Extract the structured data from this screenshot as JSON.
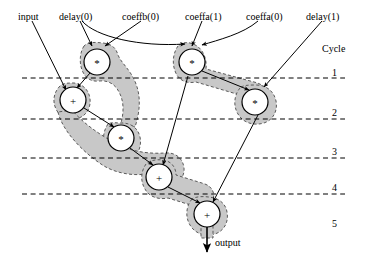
{
  "figure": {
    "type": "dataflow-scheduling-diagram",
    "title_text": "",
    "background_color": "#ffffff",
    "line_color": "#000000",
    "region_fill_color": "#c8c8c8",
    "region_border_color": "#555555",
    "node_fill_color": "#ffffff"
  },
  "top_labels": [
    {
      "id": "input",
      "text": "input",
      "x": 18,
      "y": 12
    },
    {
      "id": "delay0",
      "text": "delay(0)",
      "x": 59,
      "y": 12
    },
    {
      "id": "coeffb0",
      "text": "coeffb(0)",
      "x": 122,
      "y": 12
    },
    {
      "id": "coeffa1",
      "text": "coeffa(1)",
      "x": 185,
      "y": 12
    },
    {
      "id": "coeffa0",
      "text": "coeffa(0)",
      "x": 246,
      "y": 12
    },
    {
      "id": "delay1",
      "text": "delay(1)",
      "x": 306,
      "y": 12
    }
  ],
  "output_label": {
    "text": "output",
    "x": 215,
    "y": 238
  },
  "cycle_axis": {
    "header": "Cycle",
    "header_x": 322,
    "header_y": 44,
    "labels": [
      {
        "text": "1",
        "x": 332,
        "y": 68
      },
      {
        "text": "2",
        "x": 332,
        "y": 108
      },
      {
        "text": "3",
        "x": 332,
        "y": 147
      },
      {
        "text": "4",
        "x": 332,
        "y": 183
      },
      {
        "text": "5",
        "x": 332,
        "y": 219
      }
    ],
    "boundaries_y": [
      78,
      119,
      158,
      194
    ]
  },
  "nodes": [
    {
      "id": "m1",
      "op": "*",
      "cx": 97,
      "cy": 62,
      "r": 13,
      "cycle": 1,
      "label": "multiply-node-1"
    },
    {
      "id": "m2",
      "op": "*",
      "cx": 192,
      "cy": 62,
      "r": 13,
      "cycle": 1,
      "label": "multiply-node-2"
    },
    {
      "id": "a1",
      "op": "+",
      "cx": 73,
      "cy": 100,
      "r": 13,
      "cycle": 2,
      "label": "add-node-1"
    },
    {
      "id": "m3",
      "op": "*",
      "cx": 255,
      "cy": 102,
      "r": 13,
      "cycle": 2,
      "label": "multiply-node-3"
    },
    {
      "id": "m4",
      "op": "*",
      "cx": 121,
      "cy": 138,
      "r": 13,
      "cycle": 3,
      "label": "multiply-node-4"
    },
    {
      "id": "a2",
      "op": "+",
      "cx": 159,
      "cy": 177,
      "r": 13,
      "cycle": 4,
      "label": "add-node-2"
    },
    {
      "id": "a3",
      "op": "+",
      "cx": 207,
      "cy": 214,
      "r": 13,
      "cycle": 5,
      "label": "add-node-3"
    }
  ],
  "pointer_lines": [
    {
      "id": "input-to-a1",
      "from": [
        30,
        20
      ],
      "to": [
        63,
        92
      ],
      "arrow": true
    },
    {
      "id": "delay0-to-m1a",
      "from": [
        78,
        20
      ],
      "to": [
        90,
        46
      ],
      "arrow": true
    },
    {
      "id": "delay0-to-m2",
      "from": [
        80,
        20
      ],
      "to": [
        186,
        46
      ],
      "arrow": true
    },
    {
      "id": "coeffb0-to-m1",
      "from": [
        140,
        20
      ],
      "to": [
        104,
        46
      ],
      "arrow": true
    },
    {
      "id": "coeffa1-to-m2",
      "from": [
        200,
        20
      ],
      "to": [
        192,
        46
      ],
      "arrow": true
    },
    {
      "id": "coeffa0-to-m2b",
      "from": [
        258,
        20
      ],
      "to": [
        200,
        46
      ],
      "arrow": true
    },
    {
      "id": "delay1-to-m3",
      "from": [
        320,
        20
      ],
      "to": [
        262,
        88
      ],
      "arrow": true
    }
  ],
  "edges": [
    {
      "id": "m1-to-a1",
      "from": "m1",
      "to": "a1"
    },
    {
      "id": "a1-to-m4",
      "from": "a1",
      "to": "m4"
    },
    {
      "id": "m2-to-m3",
      "from": "m2",
      "to": "m3"
    },
    {
      "id": "m2-to-a2",
      "from": "m2",
      "to": "a2"
    },
    {
      "id": "m4-to-a2",
      "from": "m4",
      "to": "a2"
    },
    {
      "id": "a2-to-a3",
      "from": "a2",
      "to": "a3"
    },
    {
      "id": "m3-to-a3",
      "from": "m3",
      "to": "a3"
    }
  ],
  "lifetime_regions": [
    {
      "id": "region-m1",
      "label": "lifetime-region-multiply-1"
    },
    {
      "id": "region-m2",
      "label": "lifetime-region-multiply-2"
    },
    {
      "id": "region-a1",
      "label": "lifetime-region-add-1"
    },
    {
      "id": "region-m3",
      "label": "lifetime-region-multiply-3"
    },
    {
      "id": "region-m4",
      "label": "lifetime-region-multiply-4"
    },
    {
      "id": "region-a2",
      "label": "lifetime-region-add-2"
    },
    {
      "id": "region-a3",
      "label": "lifetime-region-add-3"
    }
  ]
}
